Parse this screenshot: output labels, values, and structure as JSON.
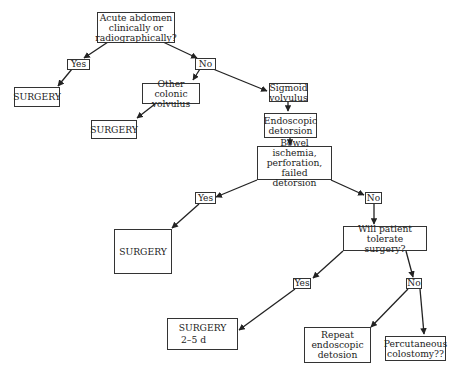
{
  "flowchart": {
    "nodes": {
      "acute_abdomen": "Acute abdomen\nclinically or\nradiographically?",
      "surgery_1": "SURGERY",
      "other_colonic": "Other colonic\nvolvulus",
      "surgery_2": "SURGERY",
      "sigmoid": "Sigmoid\nvolvulus",
      "endoscopic": "Endoscopic\ndetorsion",
      "bowel_ischemia": "Bowel ischemia,\nperforation, failed\ndetorsion",
      "surgery_3": "SURGERY",
      "tolerate": "Will patient\ntolerate surgery?",
      "surgery_4_title": "SURGERY",
      "surgery_4_time": "2–5 d",
      "repeat": "Repeat\nendoscopic\ndetosion",
      "percutaneous": "Percutaneous\ncolostomy??"
    },
    "labels": {
      "yes_1": "Yes",
      "no_1": "No",
      "yes_2": "Yes",
      "no_2": "No",
      "yes_3": "Yes",
      "no_3": "No"
    },
    "colors": {
      "line": "#222222",
      "box_border": "#333333",
      "background": "#ffffff"
    }
  }
}
